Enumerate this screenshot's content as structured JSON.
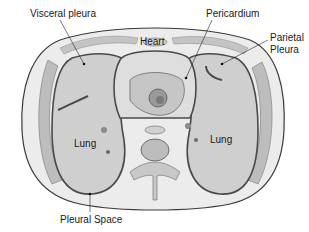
{
  "labels": {
    "visceral_pleura": "Visceral pleura",
    "pericardium": "Pericardium",
    "parietal_pleura_line1": "Parietal",
    "parietal_pleura_line2": "Pleura",
    "heart": "Heart",
    "lung_left": "Lung",
    "lung_right": "Lung",
    "pleural_space": "Pleural Space"
  },
  "colors": {
    "background": "#ffffff",
    "outline": "#3a3a3a",
    "lung_fill": "#cfcfcf",
    "tissue": "#e6e6e6",
    "muscle": "#b8b8b8",
    "pleura": "#5a5a5a",
    "text": "#1a1a1a"
  }
}
